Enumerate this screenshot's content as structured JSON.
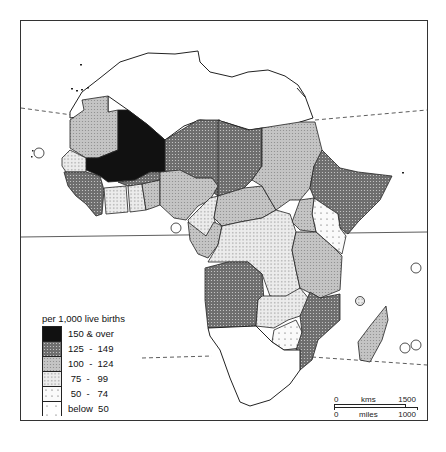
{
  "map": {
    "subject": "Infant mortality rate, Africa",
    "legend": {
      "title": "per 1,000 live births",
      "classes": [
        {
          "label": "150 & over",
          "fill": "black"
        },
        {
          "label": "125  -  149",
          "fill": "dark-dots"
        },
        {
          "label": "100  -  124",
          "fill": "medium-dots"
        },
        {
          "label": " 75  -   99",
          "fill": "light-dots"
        },
        {
          "label": " 50  -   74",
          "fill": "sparse-dots"
        },
        {
          "label": "below  50",
          "fill": "very-sparse-dots"
        }
      ]
    },
    "scale_bar": {
      "kms_start": "0",
      "kms_label": "kms",
      "kms_end": "1500",
      "miles_start": "0",
      "miles_label": "miles",
      "miles_end": "1000"
    },
    "reference_lines": [
      "Tropic of Cancer (dashed)",
      "Equator (solid)",
      "Tropic of Capricorn (dashed)"
    ]
  }
}
